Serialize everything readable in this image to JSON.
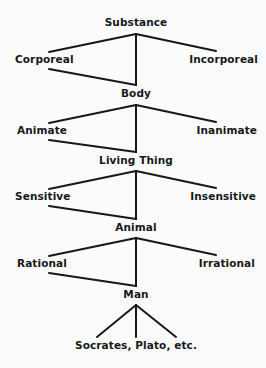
{
  "diagram": {
    "type": "hierarchical-division-tree",
    "background_color": "#fbfbfb",
    "line_color": "#16181a",
    "text_color": "#16181a",
    "levels": [
      {
        "genus": "Substance",
        "differentia_left": "Corporeal",
        "differentia_right": "Incorporeal"
      },
      {
        "genus": "Body",
        "differentia_left": "Animate",
        "differentia_right": "Inanimate"
      },
      {
        "genus": "Living Thing",
        "differentia_left": "Sensitive",
        "differentia_right": "Insensitive"
      },
      {
        "genus": "Animal",
        "differentia_left": "Rational",
        "differentia_right": "Irrational"
      }
    ],
    "species": "Man",
    "individuals": "Socrates, Plato, etc."
  }
}
